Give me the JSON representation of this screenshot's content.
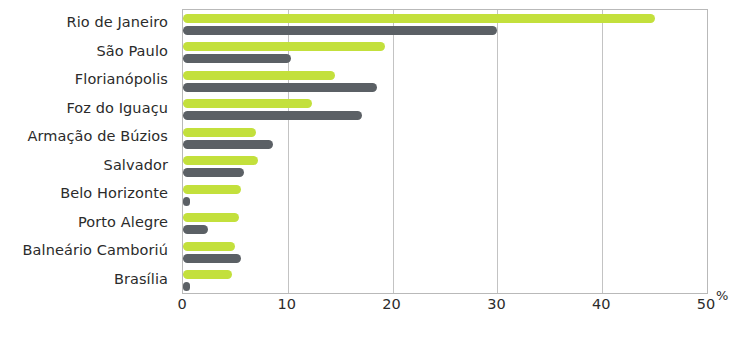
{
  "chart_data": {
    "type": "bar",
    "orientation": "horizontal",
    "title": "",
    "subtitle": "",
    "xlabel": "%",
    "ylabel": "",
    "xlim": [
      0,
      50
    ],
    "xticks": [
      0,
      10,
      20,
      30,
      40,
      50
    ],
    "xtick_labels": [
      "0",
      "10",
      "20",
      "30",
      "40",
      "50"
    ],
    "grid": "vertical",
    "legend": "none",
    "legend_position": "none",
    "categories": [
      "Rio de Janeiro",
      "São Paulo",
      "Florianópolis",
      "Foz do Iguaçu",
      "Armação de Búzios",
      "Salvador",
      "Belo Horizonte",
      "Porto Alegre",
      "Balneário Camboriú",
      "Brasília"
    ],
    "series": [
      {
        "name": "series-green",
        "color": "#c3e03c",
        "values": [
          45.0,
          19.3,
          14.5,
          12.3,
          7.0,
          7.2,
          5.5,
          5.3,
          5.0,
          4.7
        ]
      },
      {
        "name": "series-gray",
        "color": "#5b6065",
        "values": [
          30.0,
          10.3,
          18.5,
          17.1,
          8.6,
          5.8,
          0.5,
          2.4,
          5.5,
          0.5
        ]
      }
    ]
  },
  "colors": {
    "green": "#c3e03c",
    "gray": "#5b6065",
    "frame": "#b9b9b9",
    "grid": "#c3c3c3",
    "text": "#2b2b2b",
    "background": "#ffffff"
  }
}
